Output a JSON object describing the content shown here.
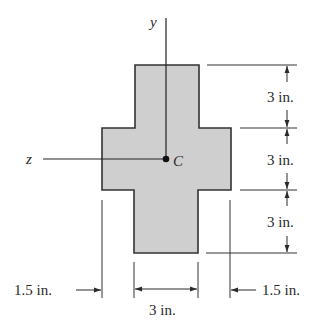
{
  "figure": {
    "shape": "cross-shaped cross section",
    "fill_color": "#cfcfcf",
    "outline_color": "#333333",
    "axes": {
      "y_label": "y",
      "z_label": "z",
      "centroid_label": "C"
    },
    "dimensions": {
      "right": [
        {
          "label": "3 in."
        },
        {
          "label": "3 in."
        },
        {
          "label": "3 in."
        }
      ],
      "bottom": {
        "left_flange": "1.5 in.",
        "web": "3 in.",
        "right_flange": "1.5 in."
      }
    }
  }
}
